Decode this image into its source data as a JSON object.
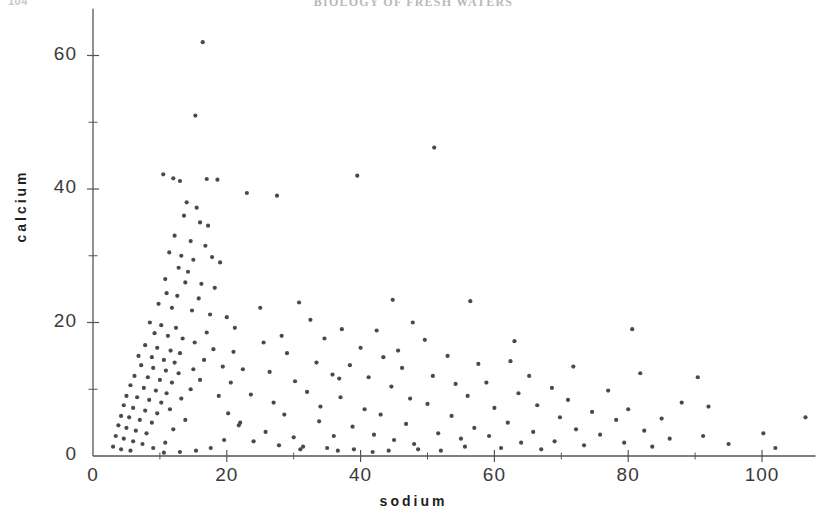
{
  "page": {
    "folio": "104",
    "running_head": "BIOLOGY OF FRESH WATERS"
  },
  "chart_data": {
    "type": "scatter",
    "title": "",
    "xlabel": "sodium",
    "ylabel": "calcium",
    "xlim": [
      0,
      108
    ],
    "ylim": [
      0,
      65
    ],
    "grid": false,
    "legend": null,
    "x_major_ticks": [
      0,
      20,
      40,
      60,
      80,
      100
    ],
    "x_minor_ticks": [
      10,
      30,
      50,
      70,
      90
    ],
    "y_major_ticks": [
      0,
      20,
      40,
      60
    ],
    "y_minor_ticks": [
      10,
      30,
      50
    ],
    "x_tick_labels": [
      "0",
      "20",
      "40",
      "60",
      "80",
      "100"
    ],
    "y_tick_labels": [
      "0",
      "20",
      "40",
      "60"
    ],
    "marker": {
      "shape": "dot",
      "size_px": 2.1,
      "color": "#4a4a4a"
    },
    "axis_color": "#555555",
    "n_points": 206,
    "points": [
      [
        16.4,
        62.0
      ],
      [
        15.3,
        51.0
      ],
      [
        10.5,
        42.2
      ],
      [
        12.0,
        41.6
      ],
      [
        13.0,
        41.2
      ],
      [
        17.0,
        41.5
      ],
      [
        18.6,
        41.4
      ],
      [
        23.0,
        39.4
      ],
      [
        27.5,
        39.0
      ],
      [
        39.5,
        42.0
      ],
      [
        51.0,
        46.2
      ],
      [
        14.0,
        38.0
      ],
      [
        15.5,
        37.2
      ],
      [
        13.6,
        36.0
      ],
      [
        16.0,
        35.0
      ],
      [
        17.2,
        34.5
      ],
      [
        12.2,
        33.0
      ],
      [
        14.6,
        32.2
      ],
      [
        16.8,
        31.5
      ],
      [
        11.4,
        30.5
      ],
      [
        13.2,
        30.0
      ],
      [
        15.0,
        29.4
      ],
      [
        17.8,
        29.8
      ],
      [
        19.0,
        29.0
      ],
      [
        12.8,
        28.2
      ],
      [
        14.2,
        27.6
      ],
      [
        10.8,
        26.5
      ],
      [
        13.8,
        26.0
      ],
      [
        16.2,
        25.8
      ],
      [
        18.2,
        25.2
      ],
      [
        11.0,
        24.4
      ],
      [
        12.6,
        24.0
      ],
      [
        15.8,
        23.6
      ],
      [
        9.8,
        22.8
      ],
      [
        11.8,
        22.2
      ],
      [
        14.8,
        21.8
      ],
      [
        17.5,
        21.2
      ],
      [
        20.0,
        20.8
      ],
      [
        8.5,
        20.0
      ],
      [
        10.2,
        19.6
      ],
      [
        12.4,
        19.2
      ],
      [
        9.2,
        18.4
      ],
      [
        11.2,
        18.0
      ],
      [
        13.4,
        17.6
      ],
      [
        15.2,
        17.0
      ],
      [
        7.8,
        16.6
      ],
      [
        9.6,
        16.2
      ],
      [
        11.6,
        15.8
      ],
      [
        13.0,
        15.4
      ],
      [
        6.8,
        15.0
      ],
      [
        8.8,
        14.8
      ],
      [
        10.6,
        14.4
      ],
      [
        12.2,
        14.0
      ],
      [
        7.2,
        13.6
      ],
      [
        9.0,
        13.2
      ],
      [
        10.9,
        12.8
      ],
      [
        12.8,
        12.4
      ],
      [
        6.2,
        12.0
      ],
      [
        8.2,
        11.8
      ],
      [
        10.0,
        11.4
      ],
      [
        11.8,
        11.0
      ],
      [
        5.6,
        10.6
      ],
      [
        7.6,
        10.2
      ],
      [
        9.4,
        9.8
      ],
      [
        11.0,
        9.4
      ],
      [
        5.0,
        9.0
      ],
      [
        6.6,
        8.8
      ],
      [
        8.4,
        8.4
      ],
      [
        10.2,
        8.0
      ],
      [
        4.6,
        7.6
      ],
      [
        6.0,
        7.2
      ],
      [
        7.8,
        6.8
      ],
      [
        9.6,
        6.4
      ],
      [
        4.2,
        6.0
      ],
      [
        5.4,
        5.8
      ],
      [
        7.0,
        5.4
      ],
      [
        8.8,
        5.0
      ],
      [
        3.8,
        4.6
      ],
      [
        5.0,
        4.2
      ],
      [
        6.4,
        3.8
      ],
      [
        8.0,
        3.4
      ],
      [
        3.4,
        3.0
      ],
      [
        4.6,
        2.6
      ],
      [
        6.0,
        2.2
      ],
      [
        7.4,
        1.8
      ],
      [
        3.0,
        1.4
      ],
      [
        4.2,
        1.0
      ],
      [
        5.6,
        0.8
      ],
      [
        9.0,
        1.2
      ],
      [
        10.8,
        2.0
      ],
      [
        12.0,
        4.0
      ],
      [
        13.8,
        5.4
      ],
      [
        11.5,
        7.0
      ],
      [
        13.2,
        8.6
      ],
      [
        14.6,
        10.0
      ],
      [
        16.0,
        11.4
      ],
      [
        15.0,
        13.0
      ],
      [
        16.6,
        14.4
      ],
      [
        18.0,
        16.0
      ],
      [
        17.0,
        18.5
      ],
      [
        19.4,
        13.4
      ],
      [
        20.6,
        11.0
      ],
      [
        18.8,
        9.0
      ],
      [
        20.2,
        6.4
      ],
      [
        21.8,
        4.6
      ],
      [
        19.6,
        2.4
      ],
      [
        17.6,
        1.2
      ],
      [
        15.4,
        0.8
      ],
      [
        13.0,
        0.6
      ],
      [
        10.6,
        0.5
      ],
      [
        21.0,
        15.6
      ],
      [
        22.4,
        13.0
      ],
      [
        23.6,
        9.2
      ],
      [
        22.0,
        5.0
      ],
      [
        24.0,
        2.2
      ],
      [
        25.5,
        17.0
      ],
      [
        26.4,
        12.6
      ],
      [
        27.0,
        8.0
      ],
      [
        25.8,
        3.6
      ],
      [
        27.8,
        1.6
      ],
      [
        29.0,
        15.4
      ],
      [
        30.2,
        11.2
      ],
      [
        28.6,
        6.2
      ],
      [
        30.0,
        2.8
      ],
      [
        31.4,
        1.4
      ],
      [
        32.5,
        20.4
      ],
      [
        33.4,
        14.0
      ],
      [
        32.0,
        9.6
      ],
      [
        33.8,
        5.2
      ],
      [
        31.0,
        1.0
      ],
      [
        34.6,
        17.6
      ],
      [
        35.8,
        12.2
      ],
      [
        34.0,
        7.4
      ],
      [
        36.0,
        3.0
      ],
      [
        35.0,
        1.2
      ],
      [
        37.2,
        19.0
      ],
      [
        38.4,
        13.6
      ],
      [
        37.0,
        8.8
      ],
      [
        38.8,
        4.4
      ],
      [
        36.6,
        0.8
      ],
      [
        40.0,
        16.2
      ],
      [
        41.2,
        11.8
      ],
      [
        40.6,
        7.0
      ],
      [
        42.0,
        3.2
      ],
      [
        39.0,
        1.0
      ],
      [
        43.4,
        14.8
      ],
      [
        44.6,
        10.4
      ],
      [
        43.0,
        6.2
      ],
      [
        45.0,
        2.4
      ],
      [
        41.8,
        0.6
      ],
      [
        46.2,
        13.2
      ],
      [
        47.4,
        8.6
      ],
      [
        46.8,
        4.8
      ],
      [
        48.0,
        1.8
      ],
      [
        44.2,
        0.8
      ],
      [
        49.6,
        17.4
      ],
      [
        50.8,
        12.0
      ],
      [
        50.0,
        7.8
      ],
      [
        51.6,
        3.4
      ],
      [
        48.6,
        1.0
      ],
      [
        53.0,
        15.0
      ],
      [
        54.2,
        10.8
      ],
      [
        53.6,
        6.0
      ],
      [
        55.0,
        2.6
      ],
      [
        52.0,
        0.8
      ],
      [
        56.4,
        23.2
      ],
      [
        57.6,
        13.8
      ],
      [
        56.0,
        9.0
      ],
      [
        57.0,
        4.2
      ],
      [
        55.6,
        1.4
      ],
      [
        58.8,
        11.0
      ],
      [
        60.0,
        7.2
      ],
      [
        59.2,
        3.0
      ],
      [
        61.0,
        1.2
      ],
      [
        47.8,
        20.0
      ],
      [
        62.4,
        14.2
      ],
      [
        63.6,
        9.4
      ],
      [
        62.0,
        5.0
      ],
      [
        64.0,
        2.0
      ],
      [
        65.2,
        12.0
      ],
      [
        66.4,
        7.6
      ],
      [
        65.8,
        3.6
      ],
      [
        67.0,
        1.0
      ],
      [
        44.8,
        23.4
      ],
      [
        42.4,
        18.8
      ],
      [
        68.6,
        10.2
      ],
      [
        69.8,
        5.8
      ],
      [
        69.0,
        2.2
      ],
      [
        71.0,
        8.4
      ],
      [
        72.2,
        4.0
      ],
      [
        73.4,
        1.6
      ],
      [
        74.6,
        6.6
      ],
      [
        75.8,
        3.2
      ],
      [
        77.0,
        9.8
      ],
      [
        78.2,
        5.4
      ],
      [
        79.4,
        2.0
      ],
      [
        80.6,
        19.0
      ],
      [
        81.8,
        12.4
      ],
      [
        80.0,
        7.0
      ],
      [
        82.4,
        3.8
      ],
      [
        83.6,
        1.4
      ],
      [
        85.0,
        5.6
      ],
      [
        86.2,
        2.6
      ],
      [
        88.0,
        8.0
      ],
      [
        90.4,
        11.8
      ],
      [
        92.0,
        7.4
      ],
      [
        91.2,
        3.0
      ],
      [
        95.0,
        1.8
      ],
      [
        100.2,
        3.4
      ],
      [
        102.0,
        1.2
      ],
      [
        106.5,
        5.8
      ],
      [
        63.0,
        17.2
      ],
      [
        71.8,
        13.4
      ],
      [
        30.8,
        23.0
      ],
      [
        25.0,
        22.2
      ],
      [
        21.2,
        19.2
      ],
      [
        28.2,
        18.0
      ],
      [
        36.8,
        11.6
      ],
      [
        45.6,
        15.8
      ]
    ]
  }
}
